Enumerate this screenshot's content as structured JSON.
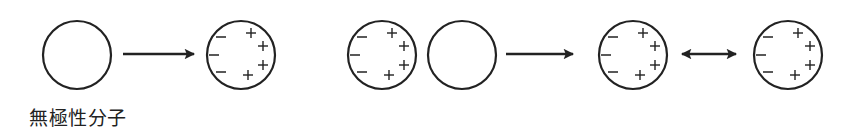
{
  "diagram": {
    "stroke_color": "#222222",
    "background": "#ffffff",
    "caption": "無極性分子",
    "molecules": [
      {
        "id": "nonpolar-1",
        "cx": 77,
        "cy": 55,
        "r": 34,
        "polarized": false
      },
      {
        "id": "induced-1",
        "cx": 241,
        "cy": 55,
        "r": 34,
        "polarized": true
      },
      {
        "id": "induced-2",
        "cx": 382,
        "cy": 55,
        "r": 34,
        "polarized": true
      },
      {
        "id": "nonpolar-2",
        "cx": 462,
        "cy": 55,
        "r": 34,
        "polarized": false
      },
      {
        "id": "induced-3",
        "cx": 633,
        "cy": 55,
        "r": 34,
        "polarized": true
      },
      {
        "id": "induced-4",
        "cx": 788,
        "cy": 55,
        "r": 34,
        "polarized": true
      }
    ],
    "arrows": [
      {
        "id": "arrow-1",
        "type": "single",
        "x1": 123,
        "x2": 194,
        "y": 54
      },
      {
        "id": "arrow-2",
        "type": "single",
        "x1": 506,
        "x2": 573,
        "y": 54
      },
      {
        "id": "arrow-3",
        "type": "double",
        "x1": 682,
        "x2": 736,
        "y": 54
      }
    ],
    "charges": {
      "negative": [
        {
          "dx": -20,
          "dy": -18
        },
        {
          "dx": -27,
          "dy": 0
        },
        {
          "dx": -20,
          "dy": 17
        }
      ],
      "positive": [
        {
          "dx": 10,
          "dy": -22
        },
        {
          "dx": 22,
          "dy": -9
        },
        {
          "dx": 22,
          "dy": 10
        },
        {
          "dx": 7,
          "dy": 20
        }
      ],
      "negative_symbol": "−",
      "positive_symbol": "+"
    }
  }
}
